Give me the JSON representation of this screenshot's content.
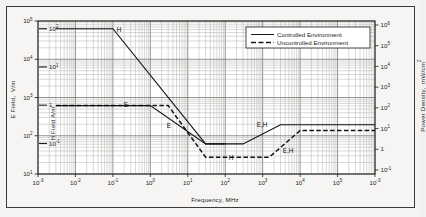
{
  "figure": {
    "background_color": "#f4f3f1",
    "border_color": "#3a3a38",
    "plot_background": "#ffffff"
  },
  "legend": {
    "position": "top-right-inside",
    "entries": [
      {
        "label": "Controlled Environment",
        "style": "solid",
        "color": "#1a1a1a"
      },
      {
        "label": "Uncontrolled Environment",
        "style": "dashed",
        "color": "#1a1a1a"
      }
    ]
  },
  "axes": {
    "x": {
      "label": "Frequency, MHz",
      "ticks": [
        "10-3",
        "10-2",
        "10-1",
        "100",
        "101",
        "102",
        "103",
        "104",
        "105",
        "10-3"
      ],
      "tick_mantissa": [
        "10",
        "10",
        "10",
        "10",
        "10",
        "10",
        "10",
        "10",
        "10",
        "10"
      ],
      "tick_exponents": [
        "-3",
        "-2",
        "-1",
        "0",
        "1",
        "2",
        "3",
        "4",
        "5",
        "-3"
      ],
      "range": [
        -3,
        6
      ],
      "scale": "log"
    },
    "y_left": {
      "label": "E Field,  V/m",
      "tick_exponents": [
        "5",
        "4",
        "3",
        "2",
        "1"
      ],
      "range": [
        1,
        5
      ],
      "scale": "log"
    },
    "y_inner": {
      "label": "H Field A/m",
      "tick_exponents": [
        "2",
        "1",
        "0",
        "-1"
      ],
      "tick_text": [
        "102",
        "101",
        "1",
        "10-1"
      ],
      "scale": "log"
    },
    "y_right": {
      "label": "Power Density,  mW/cm2",
      "tick_exponents": [
        "6",
        "5",
        "4",
        "3",
        "2",
        "1",
        "0",
        "-1"
      ],
      "tick_text": [
        "106",
        "105",
        "104",
        "103",
        "102",
        "101",
        "1",
        "10-1"
      ],
      "scale": "log"
    },
    "grid": "log-minor-and-major"
  },
  "annotations": [
    {
      "text": "H",
      "x_mhz": 0.1,
      "note": "end of H-field controlled plateau"
    },
    {
      "text": "E",
      "x_mhz": 0.35,
      "note": "E-field controlled plateau"
    },
    {
      "text": "E",
      "x_mhz": 4,
      "note": "E-field uncontrolled slope"
    },
    {
      "text": "H",
      "x_mhz": 90,
      "note": "H-field minimum region"
    },
    {
      "text": "E,H",
      "x_mhz": 600,
      "note": "controlled rising segment"
    },
    {
      "text": "E,H",
      "x_mhz": 1400,
      "note": "uncontrolled rising segment"
    }
  ],
  "chart_data": {
    "type": "line",
    "title": "",
    "xlabel": "Frequency, MHz",
    "ylabel": "E Field, V/m",
    "ylabel_right": "Power Density, mW/cm2",
    "xscale": "log",
    "yscale": "log",
    "xlim": [
      0.001,
      1000000
    ],
    "ylim": [
      10,
      100000
    ],
    "grid": true,
    "legend_position": "upper right",
    "series": [
      {
        "name": "Controlled Environment",
        "style": "solid",
        "x": [
          0.003,
          0.1,
          30,
          100,
          300,
          3000,
          1000000
        ],
        "y": [
          63000,
          63000,
          61.4,
          61.4,
          61.4,
          194,
          194
        ],
        "note": "H-field / E-field composite controlled MPE envelope"
      },
      {
        "name": "Controlled Environment E branch",
        "style": "solid",
        "x": [
          0.003,
          1.0,
          30,
          100
        ],
        "y": [
          614,
          614,
          61.4,
          61.4
        ],
        "note": "E-field controlled limit, 614 V/m below 1 MHz then 1842/f"
      },
      {
        "name": "Uncontrolled Environment",
        "style": "dashed",
        "x": [
          0.003,
          3.0,
          30,
          300,
          1500,
          10000,
          1000000
        ],
        "y": [
          614,
          614,
          27.5,
          27.5,
          27.5,
          137,
          137
        ],
        "note": "E-field uncontrolled limit 614 V/m then 824/f, floor 27.5 V/m"
      }
    ],
    "x_tick_values": [
      0.001,
      0.01,
      0.1,
      1,
      10,
      100,
      1000,
      10000,
      100000,
      1000000
    ],
    "y_tick_values": [
      10,
      100,
      1000,
      10000,
      100000
    ]
  }
}
